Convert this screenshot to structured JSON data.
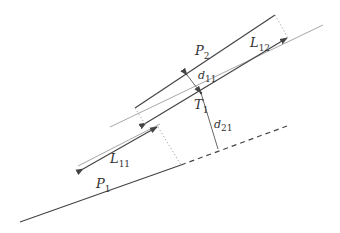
{
  "diagram": {
    "labels": {
      "P2": {
        "base": "P",
        "sub": "2"
      },
      "L12": {
        "base": "L",
        "sub": "12"
      },
      "d11": {
        "base": "d",
        "sub": "11"
      },
      "T1": {
        "base": "T",
        "sub": "1"
      },
      "d21": {
        "base": "d",
        "sub": "21"
      },
      "L11": {
        "base": "L",
        "sub": "11"
      },
      "P1": {
        "base": "P",
        "sub": "1"
      }
    },
    "colors": {
      "dark_line": "#444444",
      "gray_line": "#a8a8a8",
      "dotted_line": "#b0b0b0",
      "label_text": "#333333"
    }
  }
}
